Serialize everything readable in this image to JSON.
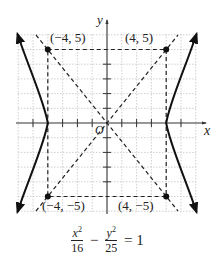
{
  "diagram": {
    "type": "hyperbola-graph",
    "axes": {
      "x_label": "x",
      "y_label": "y",
      "origin_label": "O",
      "range": [
        -6,
        6
      ]
    },
    "points": [
      {
        "label": "(−4, 5)",
        "x": -4,
        "y": 5
      },
      {
        "label": "(4, 5)",
        "x": 4,
        "y": 5
      },
      {
        "label": "(−4, −5)",
        "x": -4,
        "y": -5
      },
      {
        "label": "(4, −5)",
        "x": 4,
        "y": -5
      }
    ],
    "asymptotes": [
      "y = 5x/4",
      "y = -5x/4"
    ],
    "vertices": [
      [
        -4,
        0
      ],
      [
        4,
        0
      ]
    ],
    "equation": {
      "term1_num": "x",
      "term1_den": "16",
      "term2_num": "y",
      "term2_den": "25",
      "exp": "2",
      "minus": "−",
      "equals": "= 1"
    },
    "colors": {
      "curve": "#111111",
      "grid": "#bbbbbb",
      "dashed": "#222222"
    }
  }
}
